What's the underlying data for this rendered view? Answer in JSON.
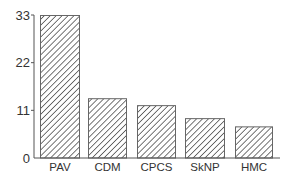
{
  "chart_data": {
    "type": "bar",
    "title": "",
    "xlabel": "",
    "ylabel": "",
    "categories": [
      "PAV",
      "CDM",
      "CPCS",
      "SkNP",
      "HMC"
    ],
    "values": [
      33,
      13.8,
      12.2,
      9.2,
      7.3
    ],
    "ylim": [
      0,
      33
    ],
    "yticks": [
      0,
      11,
      22,
      33
    ],
    "ytick_labels": [
      "0",
      "11",
      "22",
      "33"
    ],
    "grid": false,
    "legend": null,
    "bar_style": "diagonal-hatch",
    "colors": {
      "bar_fill": "#ffffff",
      "hatch": "#444444",
      "axis": "#555555",
      "text": "#333333"
    }
  }
}
